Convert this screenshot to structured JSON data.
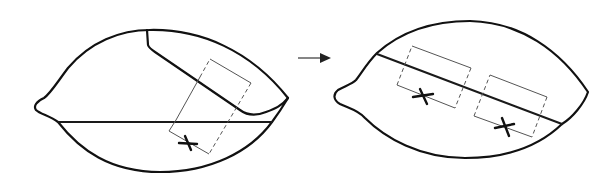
{
  "figure": {
    "type": "two-panel schematic diagram",
    "panels": [
      {
        "id": "before",
        "description": "Leaf-shaped outline with a folded upper flap, a horizontal cut line, and a tilted rectangular region marked with an X",
        "elements": {
          "outline": "leaf/lemon shape with pointed left tip",
          "fold_flap": "upper-right flap folded down along a diagonal",
          "horizontal_line": "straight line across lower third",
          "rectangle": "tilted rectangle with two solid sides and two dashed sides",
          "x_marks": 1
        }
      },
      {
        "id": "after",
        "description": "Unfolded leaf-shaped outline with a single diagonal line and two tilted rectangles each marked with an X",
        "elements": {
          "outline": "leaf/lemon shape with pointed left tip",
          "diagonal_line": "straight line from upper-left to lower-right",
          "rectangles": 2,
          "x_marks": 2
        }
      }
    ],
    "connector": {
      "type": "arrow",
      "direction": "right",
      "meaning": "transformation from left panel to right panel"
    },
    "colors": {
      "stroke": "#111111",
      "box_stroke": "#555555",
      "background": "#ffffff"
    }
  }
}
